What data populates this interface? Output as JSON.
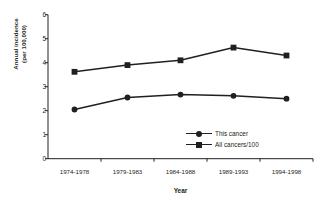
{
  "chart_data": {
    "type": "line",
    "title": "",
    "subtitle": "",
    "xlabel": "Year",
    "ylabel_line1": "Annual incidence",
    "ylabel_line2": "(per 100,000)",
    "categories": [
      "1974-1978",
      "1979-1983",
      "1984-1988",
      "1989-1993",
      "1994-1998"
    ],
    "ylim": [
      0,
      6
    ],
    "ytick_labels": [
      "0",
      "1",
      "2",
      "3",
      "4",
      "5",
      "6"
    ],
    "ytick_values": [
      0,
      1,
      2,
      3,
      4,
      5,
      6
    ],
    "grid": false,
    "legend_position": "inside-lower-right",
    "series": [
      {
        "name": "This cancer",
        "marker": "circle",
        "color": "#231f20",
        "values": [
          2.05,
          2.55,
          2.67,
          2.62,
          2.5
        ]
      },
      {
        "name": "All cancers/100",
        "marker": "square",
        "color": "#231f20",
        "values": [
          3.62,
          3.9,
          4.1,
          4.63,
          4.3
        ]
      }
    ]
  },
  "legend": {
    "items": [
      {
        "label": "This cancer",
        "marker": "circle"
      },
      {
        "label": "All cancers/100",
        "marker": "square"
      }
    ]
  },
  "colors": {
    "axis": "#231f20",
    "series": "#231f20",
    "background": "#ffffff"
  }
}
